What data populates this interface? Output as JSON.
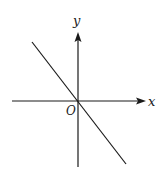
{
  "diagram": {
    "type": "coordinate-plane",
    "x_axis_label": "x",
    "y_axis_label": "y",
    "origin_label": "O",
    "line": {
      "passes_through_origin": true,
      "slope_sign": "negative",
      "quadrants": [
        "II",
        "IV"
      ]
    },
    "colors": {
      "stroke": "#1a1a1a",
      "background": "#ffffff"
    }
  }
}
